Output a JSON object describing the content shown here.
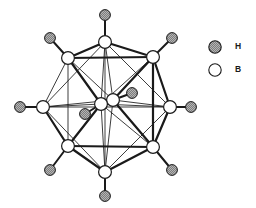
{
  "figure": {
    "background_color": "#ffffff",
    "line_color": "#1a1a1a"
  },
  "legend": {
    "position": "right",
    "entries": [
      {
        "symbol": "H",
        "label": "H",
        "marker": "hatched-gray-circle",
        "fill": "#9a9a9a",
        "stroke": "#1a1a1a",
        "cx": 215,
        "cy": 47,
        "r": 6.2,
        "label_x": 235,
        "label_y": 47
      },
      {
        "symbol": "B",
        "label": "B",
        "marker": "open-white-circle",
        "fill": "#ffffff",
        "stroke": "#1a1a1a",
        "cx": 215,
        "cy": 70,
        "r": 6.2,
        "label_x": 235,
        "label_y": 70
      }
    ]
  },
  "structure": {
    "formula": "B10H10",
    "boron_count": 10,
    "hydrogen_count": 10,
    "boron_radius": 6.4,
    "hydrogen_radius": 5.4,
    "boron_fill": "#ffffff",
    "boron_stroke": "#1a1a1a",
    "hydrogen_fill": "#a0a0a0",
    "hydrogen_stroke": "#1a1a1a",
    "atoms": [
      {
        "id": "B1",
        "element": "B",
        "x": 105,
        "y": 42,
        "site": "top"
      },
      {
        "id": "B2",
        "element": "B",
        "x": 153,
        "y": 57,
        "site": "upper-right"
      },
      {
        "id": "B3",
        "element": "B",
        "x": 170,
        "y": 107,
        "site": "right"
      },
      {
        "id": "B4",
        "element": "B",
        "x": 153,
        "y": 147,
        "site": "lower-right"
      },
      {
        "id": "B5",
        "element": "B",
        "x": 105,
        "y": 172,
        "site": "bottom"
      },
      {
        "id": "B6",
        "element": "B",
        "x": 68,
        "y": 146,
        "site": "lower-left"
      },
      {
        "id": "B7",
        "element": "B",
        "x": 43,
        "y": 107,
        "site": "left"
      },
      {
        "id": "B8",
        "element": "B",
        "x": 68,
        "y": 58,
        "site": "upper-left"
      },
      {
        "id": "B9",
        "element": "B",
        "x": 113,
        "y": 100,
        "site": "interior-front"
      },
      {
        "id": "B10",
        "element": "B",
        "x": 101,
        "y": 104,
        "site": "interior-back"
      },
      {
        "id": "H1",
        "element": "H",
        "x": 105,
        "y": 15,
        "bonded_to": "B1"
      },
      {
        "id": "H2",
        "element": "H",
        "x": 172,
        "y": 38,
        "bonded_to": "B2"
      },
      {
        "id": "H3",
        "element": "H",
        "x": 191,
        "y": 107,
        "bonded_to": "B3"
      },
      {
        "id": "H4",
        "element": "H",
        "x": 172,
        "y": 170,
        "bonded_to": "B4"
      },
      {
        "id": "H5",
        "element": "H",
        "x": 105,
        "y": 196,
        "bonded_to": "B5"
      },
      {
        "id": "H6",
        "element": "H",
        "x": 50,
        "y": 170,
        "bonded_to": "B6"
      },
      {
        "id": "H7",
        "element": "H",
        "x": 20,
        "y": 107,
        "bonded_to": "B7"
      },
      {
        "id": "H8",
        "element": "H",
        "x": 50,
        "y": 38,
        "bonded_to": "B8"
      },
      {
        "id": "H9",
        "element": "H",
        "x": 132,
        "y": 93,
        "bonded_to": "B9"
      },
      {
        "id": "H10",
        "element": "H",
        "x": 85,
        "y": 114,
        "bonded_to": "B10"
      }
    ],
    "bonds": [
      {
        "from": "B1",
        "to": "B2",
        "weight": "thick"
      },
      {
        "from": "B2",
        "to": "B3",
        "weight": "thick"
      },
      {
        "from": "B3",
        "to": "B4",
        "weight": "thick"
      },
      {
        "from": "B4",
        "to": "B5",
        "weight": "thick"
      },
      {
        "from": "B5",
        "to": "B6",
        "weight": "thick"
      },
      {
        "from": "B6",
        "to": "B7",
        "weight": "thick"
      },
      {
        "from": "B7",
        "to": "B8",
        "weight": "thin"
      },
      {
        "from": "B8",
        "to": "B1",
        "weight": "thick"
      },
      {
        "from": "B8",
        "to": "B2",
        "weight": "thick"
      },
      {
        "from": "B2",
        "to": "B4",
        "weight": "thick"
      },
      {
        "from": "B4",
        "to": "B6",
        "weight": "thick"
      },
      {
        "from": "B6",
        "to": "B8",
        "weight": "thin"
      },
      {
        "from": "B1",
        "to": "B5",
        "weight": "thin"
      },
      {
        "from": "B3",
        "to": "B7",
        "weight": "thin"
      },
      {
        "from": "B1",
        "to": "B3",
        "weight": "thin"
      },
      {
        "from": "B1",
        "to": "B7",
        "weight": "thin"
      },
      {
        "from": "B5",
        "to": "B3",
        "weight": "thin"
      },
      {
        "from": "B5",
        "to": "B7",
        "weight": "thin"
      },
      {
        "from": "B9",
        "to": "B10",
        "weight": "thick"
      },
      {
        "from": "B9",
        "to": "B1",
        "weight": "thin"
      },
      {
        "from": "B9",
        "to": "B2",
        "weight": "thick"
      },
      {
        "from": "B9",
        "to": "B3",
        "weight": "thin"
      },
      {
        "from": "B9",
        "to": "B4",
        "weight": "thick"
      },
      {
        "from": "B9",
        "to": "B5",
        "weight": "thin"
      },
      {
        "from": "B10",
        "to": "B1",
        "weight": "thin"
      },
      {
        "from": "B10",
        "to": "B5",
        "weight": "thin"
      },
      {
        "from": "B10",
        "to": "B6",
        "weight": "thick"
      },
      {
        "from": "B10",
        "to": "B7",
        "weight": "thin"
      },
      {
        "from": "B10",
        "to": "B8",
        "weight": "thick"
      },
      {
        "from": "B10",
        "to": "B3",
        "weight": "thin"
      },
      {
        "from": "B9",
        "to": "B7",
        "weight": "thin"
      },
      {
        "from": "B9",
        "to": "B8",
        "weight": "thin"
      },
      {
        "from": "B10",
        "to": "B2",
        "weight": "thin"
      },
      {
        "from": "B10",
        "to": "B4",
        "weight": "thin"
      }
    ]
  }
}
